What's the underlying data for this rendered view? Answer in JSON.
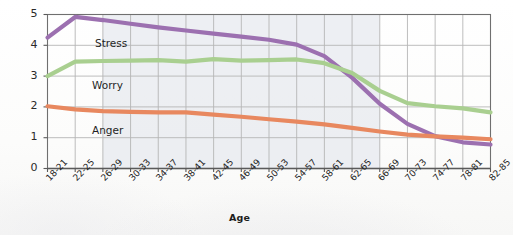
{
  "chart_data": {
    "type": "line",
    "title": "",
    "xlabel": "Age",
    "ylabel": "",
    "ylim": [
      0,
      5
    ],
    "yticks": [
      0,
      1,
      2,
      3,
      4,
      5
    ],
    "ytick_labels": [
      "0",
      "1",
      "2",
      "3",
      "4",
      "5"
    ],
    "grid": true,
    "legend": "inline-labels",
    "categories": [
      "18-21",
      "22-25",
      "26-29",
      "30-33",
      "34-37",
      "38-41",
      "42-45",
      "46-49",
      "50-53",
      "54-57",
      "58-61",
      "62-65",
      "66-69",
      "70-73",
      "74-77",
      "78-81",
      "82-85"
    ],
    "series": [
      {
        "name": "Stress",
        "color": "#9c70b0",
        "values": [
          4.25,
          4.92,
          4.82,
          4.7,
          4.58,
          4.48,
          4.38,
          4.28,
          4.18,
          4.02,
          3.65,
          2.95,
          2.1,
          1.45,
          1.05,
          0.85,
          0.78
        ]
      },
      {
        "name": "Worry",
        "color": "#a9cf90",
        "values": [
          3.0,
          3.47,
          3.49,
          3.5,
          3.52,
          3.47,
          3.55,
          3.5,
          3.52,
          3.54,
          3.42,
          3.1,
          2.52,
          2.12,
          2.02,
          1.95,
          1.82
        ]
      },
      {
        "name": "Anger",
        "color": "#e8885f",
        "values": [
          2.02,
          1.92,
          1.86,
          1.84,
          1.82,
          1.82,
          1.75,
          1.68,
          1.6,
          1.52,
          1.43,
          1.32,
          1.2,
          1.1,
          1.04,
          1.0,
          0.95
        ]
      }
    ],
    "series_label_positions": [
      {
        "name": "Stress",
        "x": 95,
        "y": 37
      },
      {
        "name": "Worry",
        "x": 92,
        "y": 79
      },
      {
        "name": "Anger",
        "x": 92,
        "y": 124
      }
    ],
    "colors": {
      "stress": "#9c70b0",
      "worry": "#a9cf90",
      "anger": "#e8885f",
      "grid": "#b6b6b6",
      "axis": "#5a5a5a",
      "shaded_band": "#e7e9ef"
    },
    "shaded_band": {
      "from_category": "26-29",
      "to_category": "66-69"
    }
  }
}
